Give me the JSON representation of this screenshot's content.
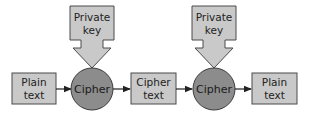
{
  "diagram": {
    "title": "",
    "colors": {
      "box_fill": "#c9c9c9",
      "box_stroke": "#4a4a4a",
      "circle_fill": "#8c8c8c",
      "circle_stroke": "#3c3c3c",
      "arrow": "#222222"
    },
    "nodes": [
      {
        "id": "plain1",
        "shape": "box",
        "line1": "Plain",
        "line2": "text"
      },
      {
        "id": "cipher1",
        "shape": "circle",
        "label": "Cipher"
      },
      {
        "id": "ciphertext",
        "shape": "box",
        "line1": "Cipher",
        "line2": "text"
      },
      {
        "id": "cipher2",
        "shape": "circle",
        "label": "Cipher"
      },
      {
        "id": "plain2",
        "shape": "box",
        "line1": "Plain",
        "line2": "text"
      }
    ],
    "keys": [
      {
        "id": "key1",
        "shape": "block-arrow-down",
        "line1": "Private",
        "line2": "key",
        "target": "cipher1"
      },
      {
        "id": "key2",
        "shape": "block-arrow-down",
        "line1": "Private",
        "line2": "key",
        "target": "cipher2"
      }
    ],
    "edges": [
      {
        "from": "plain1",
        "to": "cipher1"
      },
      {
        "from": "cipher1",
        "to": "ciphertext"
      },
      {
        "from": "ciphertext",
        "to": "cipher2"
      },
      {
        "from": "cipher2",
        "to": "plain2"
      }
    ]
  }
}
